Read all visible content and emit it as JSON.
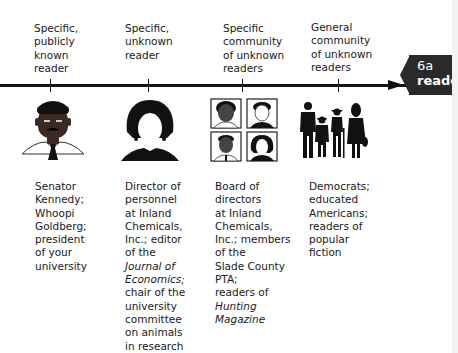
{
  "badge": {
    "number": "6a",
    "word": "reader",
    "background": "#2a2a2a"
  },
  "columns": [
    {
      "label": "Specific,\npublicly\nknown\nreader",
      "icon": "senator-portrait-icon",
      "description": [
        {
          "text": "Senator",
          "italic": false
        },
        {
          "text": "Kennedy;",
          "italic": false
        },
        {
          "text": "Whoopi",
          "italic": false
        },
        {
          "text": "Goldberg;",
          "italic": false
        },
        {
          "text": "president",
          "italic": false
        },
        {
          "text": "of your",
          "italic": false
        },
        {
          "text": "university",
          "italic": false
        }
      ]
    },
    {
      "label": "Specific,\nunknown\nreader",
      "icon": "faceless-woman-silhouette-icon",
      "description": [
        {
          "text": "Director of",
          "italic": false
        },
        {
          "text": "personnel",
          "italic": false
        },
        {
          "text": "at Inland",
          "italic": false
        },
        {
          "text": "Chemicals,",
          "italic": false
        },
        {
          "text": "Inc.; editor",
          "italic": false
        },
        {
          "text": "of the",
          "italic": false
        },
        {
          "text": "Journal of",
          "italic": true
        },
        {
          "text": "Economics;",
          "italic": true
        },
        {
          "text": "chair of the",
          "italic": false
        },
        {
          "text": "university",
          "italic": false
        },
        {
          "text": "committee",
          "italic": false
        },
        {
          "text": "on animals",
          "italic": false
        },
        {
          "text": "in research",
          "italic": false
        }
      ]
    },
    {
      "label": "Specific\ncommunity\nof unknown\nreaders",
      "icon": "four-portraits-grid-icon",
      "description": [
        {
          "text": "Board of",
          "italic": false
        },
        {
          "text": "directors",
          "italic": false
        },
        {
          "text": "at Inland",
          "italic": false
        },
        {
          "text": "Chemicals,",
          "italic": false
        },
        {
          "text": "Inc.; members",
          "italic": false
        },
        {
          "text": "of the",
          "italic": false
        },
        {
          "text": "Slade County",
          "italic": false
        },
        {
          "text": "PTA;",
          "italic": false
        },
        {
          "text": "readers of",
          "italic": false
        },
        {
          "text": "Hunting",
          "italic": true
        },
        {
          "text": "Magazine",
          "italic": true
        }
      ]
    },
    {
      "label": "General\ncommunity\nof unknown\nreaders",
      "icon": "crowd-silhouettes-icon",
      "description": [
        {
          "text": "Democrats;",
          "italic": false
        },
        {
          "text": "educated",
          "italic": false
        },
        {
          "text": "Americans;",
          "italic": false
        },
        {
          "text": "readers of",
          "italic": false
        },
        {
          "text": "popular",
          "italic": false
        },
        {
          "text": "fiction",
          "italic": false
        }
      ]
    }
  ]
}
